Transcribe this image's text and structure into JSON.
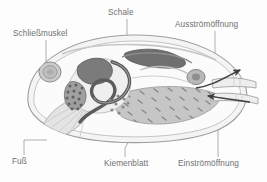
{
  "figure": {
    "background_color": "#fdfdfd",
    "label_color": "#6f6f6f",
    "leader_color": "#9a9a9a"
  },
  "labels": {
    "schliessmuskel": "Schließmuskel",
    "schale": "Schale",
    "ausstroemoeffnung": "Ausströmöffnung",
    "fuss": "Fuß",
    "kiemenblatt": "Kiemenblatt",
    "einstroemoeffnung": "Einströmöffnung"
  },
  "anatomy": {
    "shell": {
      "name": "Schale",
      "fill": "#f2f2f2",
      "stroke": "#9e9e9e"
    },
    "mantle": {
      "name": "Mantel",
      "fill": "#fafafa",
      "stroke": "#b4b4b4"
    },
    "adductor_anterior": {
      "name": "Schließmuskel",
      "fill": "#c9c9c9",
      "stroke": "#8d8d8d"
    },
    "adductor_posterior": {
      "name": "hinterer Schließmuskel",
      "fill": "#b8b8b8",
      "stroke": "#7f7f7f"
    },
    "heart": {
      "name": "Herz",
      "fill": "#6d6d6d",
      "stroke": "#555555"
    },
    "pericardium": {
      "name": "Perikard",
      "fill": "#7a7a7a",
      "stroke": "#5e5e5e"
    },
    "gonad": {
      "name": "Gonade",
      "fill": "#9b9b9b",
      "stroke": "#6a6a6a"
    },
    "gut": {
      "name": "Darm",
      "fill": "none",
      "stroke": "#5c5c5c"
    },
    "gill": {
      "name": "Kiemenblatt",
      "fill": "#c4c4c4",
      "stroke": "#9a9a9a"
    },
    "foot": {
      "name": "Fuß",
      "fill": "#e2e2e2",
      "stroke": "#a8a8a8"
    },
    "ganglion": {
      "name": "Pedalganglion",
      "fill": "#ffffff",
      "stroke": "#9a9a9a"
    },
    "siphon_exhalant": {
      "name": "Ausströmöffnung",
      "fill": "#ededed",
      "stroke": "#a0a0a0"
    },
    "siphon_inhalant": {
      "name": "Einströmöffnung",
      "fill": "#ededed",
      "stroke": "#a0a0a0"
    }
  },
  "flow_arrows": [
    {
      "name": "exhalant-flow",
      "direction": "out",
      "label": "Ausströmöffnung"
    },
    {
      "name": "inhalant-flow",
      "direction": "in",
      "label": "Einströmöffnung"
    }
  ]
}
